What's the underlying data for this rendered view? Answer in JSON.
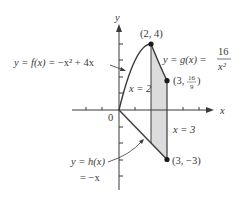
{
  "figure": {
    "axes": {
      "x_label": "x",
      "y_label": "y",
      "origin_label": "0"
    },
    "curves": {
      "f": {
        "label_lhs": "y = f(x) = ",
        "label_rhs": "−x² + 4x",
        "equation": "y = f(x) = -x^2 + 4x"
      },
      "g": {
        "label_lhs": "y = g(x) = ",
        "numerator": "16",
        "denominator": "x²",
        "equation": "y = g(x) = 16/x^2"
      },
      "h": {
        "label_line1": "y = h(x)",
        "label_line2": "= −x",
        "equation": "y = h(x) = -x"
      }
    },
    "vertical_lines": {
      "x2": "x = 2",
      "x3": "x = 3"
    },
    "points": [
      {
        "name": "peak",
        "label": "(2, 4)",
        "x": 2,
        "y": 4
      },
      {
        "name": "g-at-3",
        "label_prefix": "(3, ",
        "label_num": "16",
        "label_den": "9",
        "label_suffix": ")",
        "x": 3,
        "y": 1.7778
      },
      {
        "name": "h-at-3",
        "label": "(3, −3)",
        "x": 3,
        "y": -3
      }
    ],
    "shaded_region": "area between x = 2 and x = 3, bounded above by y = g(x) and below by y = h(x)",
    "colors": {
      "ink": "#3a3a3a",
      "shade": "#dcdcdc"
    }
  }
}
